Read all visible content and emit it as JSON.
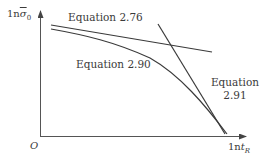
{
  "figure": {
    "y_axis_label": {
      "prefix": "1n",
      "symbol": "σ",
      "subscript": "0",
      "overline": true
    },
    "x_axis_label": {
      "prefix": "1n",
      "symbol": "t",
      "subscript": "R"
    },
    "origin_label": "O",
    "curves": [
      {
        "id": "eq-2-76",
        "label": "Equation 2.76",
        "type": "line"
      },
      {
        "id": "eq-2-90",
        "label": "Equation 2.90",
        "type": "curve"
      },
      {
        "id": "eq-2-91",
        "label_line1": "Equation",
        "label_line2": "2.91",
        "type": "line"
      }
    ],
    "colors": {
      "line": "#3a3a3a",
      "axis": "#555555",
      "text": "#3a3a3a"
    }
  }
}
